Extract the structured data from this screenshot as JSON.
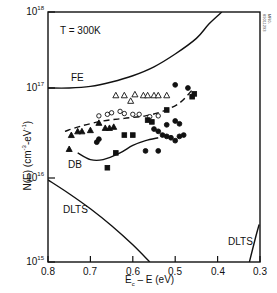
{
  "chart_data": {
    "type": "scatter",
    "title": "",
    "annotation_temperature": "T = 300K",
    "xlabel": "Ec – E (eV)",
    "xlabel_main": "E",
    "xlabel_sub": "c",
    "xlabel_rest": " – E (eV)",
    "ylabel": "N(E) (cm-3-eV-1)",
    "ylabel_parts": {
      "main": "N(E) (cm",
      "sup1": "-3",
      "mid": "-eV",
      "sup2": "-1",
      "end": ")"
    },
    "xlim": [
      0.8,
      0.3
    ],
    "x_reversed": true,
    "ylim": [
      1000000000000000.0,
      1e+18
    ],
    "yscale": "log",
    "x_ticks": [
      "0.8",
      "0.7",
      "0.6",
      "0.5",
      "0.4",
      "0.3"
    ],
    "y_ticks": [
      {
        "base": "10",
        "exp": "18"
      },
      {
        "base": "10",
        "exp": "17"
      },
      {
        "base": "10",
        "exp": "16"
      },
      {
        "base": "10",
        "exp": "15"
      }
    ],
    "curve_labels": {
      "fe": "FE",
      "db": "DB",
      "dlts_left": "DLTS",
      "dlts_right": "DLTS"
    },
    "figure_id": "MR0-89011293",
    "series": [
      {
        "name": "FE",
        "style": "solid-line",
        "points": [
          [
            0.8,
            1e+17
          ],
          [
            0.75,
            1e+17
          ],
          [
            0.7,
            1.05e+17
          ],
          [
            0.65,
            1.2e+17
          ],
          [
            0.6,
            1.45e+17
          ],
          [
            0.55,
            1.9e+17
          ],
          [
            0.5,
            2.8e+17
          ],
          [
            0.45,
            4.5e+17
          ],
          [
            0.42,
            7e+17
          ],
          [
            0.39,
            1e+18
          ]
        ]
      },
      {
        "name": "DB",
        "style": "solid-line",
        "points": [
          [
            0.73,
            1.9e+16
          ],
          [
            0.7,
            1.6e+16
          ],
          [
            0.67,
            1.6e+16
          ],
          [
            0.63,
            1.9e+16
          ],
          [
            0.6,
            2.3e+16
          ],
          [
            0.57,
            2.6e+16
          ],
          [
            0.54,
            2.8e+16
          ]
        ]
      },
      {
        "name": "Dashed fit",
        "style": "dashed-line",
        "points": [
          [
            0.76,
            3.3e+16
          ],
          [
            0.72,
            3.8e+16
          ],
          [
            0.67,
            4.3e+16
          ],
          [
            0.62,
            4.6e+16
          ],
          [
            0.57,
            4.9e+16
          ],
          [
            0.53,
            5.5e+16
          ],
          [
            0.49,
            6.8e+16
          ],
          [
            0.46,
            9.5e+16
          ]
        ]
      },
      {
        "name": "DLTS (left)",
        "style": "solid-line",
        "points": [
          [
            0.8,
            9500000000000000.0
          ],
          [
            0.75,
            6500000000000000.0
          ],
          [
            0.7,
            4300000000000000.0
          ],
          [
            0.65,
            2700000000000000.0
          ],
          [
            0.6,
            1600000000000000.0
          ],
          [
            0.56,
            1000000000000000.0
          ]
        ]
      },
      {
        "name": "DLTS (right)",
        "style": "solid-line",
        "points": [
          [
            0.325,
            1000000000000000.0
          ],
          [
            0.31,
            2000000000000000.0
          ],
          [
            0.302,
            2800000000000000.0
          ]
        ]
      },
      {
        "name": "Open triangles",
        "marker": "triangle-open",
        "points": [
          [
            0.64,
            8.3e+16
          ],
          [
            0.62,
            8.3e+16
          ],
          [
            0.605,
            7.2e+16
          ],
          [
            0.595,
            8.5e+16
          ],
          [
            0.575,
            8.3e+16
          ],
          [
            0.565,
            8.3e+16
          ],
          [
            0.55,
            8.3e+16
          ],
          [
            0.54,
            8.3e+16
          ],
          [
            0.52,
            8.3e+16
          ]
        ]
      },
      {
        "name": "Filled triangles",
        "marker": "triangle-filled",
        "points": [
          [
            0.75,
            2.1e+16
          ],
          [
            0.745,
            3e+16
          ],
          [
            0.73,
            3.3e+16
          ],
          [
            0.72,
            3.3e+16
          ],
          [
            0.7,
            3.4e+16
          ],
          [
            0.68,
            4.1e+16
          ],
          [
            0.665,
            3.6e+16
          ],
          [
            0.655,
            3.6e+16
          ],
          [
            0.645,
            3.7e+16
          ]
        ]
      },
      {
        "name": "Open circles",
        "marker": "circle-open",
        "points": [
          [
            0.68,
            4.9e+16
          ],
          [
            0.66,
            5.1e+16
          ],
          [
            0.65,
            5.3e+16
          ],
          [
            0.63,
            5.5e+16
          ],
          [
            0.62,
            5.2e+16
          ],
          [
            0.6,
            5.1e+16
          ],
          [
            0.585,
            5.1e+16
          ],
          [
            0.56,
            4.8e+16
          ],
          [
            0.54,
            4.9e+16
          ]
        ]
      },
      {
        "name": "Filled squares",
        "marker": "square-filled",
        "points": [
          [
            0.62,
            3e+16
          ],
          [
            0.6,
            3e+16
          ],
          [
            0.565,
            4.4e+16
          ],
          [
            0.555,
            4.2e+16
          ],
          [
            0.64,
            1.9e+16
          ],
          [
            0.66,
            1.3e+16
          ],
          [
            0.52,
            5.7e+16
          ],
          [
            0.46,
            8e+16
          ],
          [
            0.455,
            8.6e+16
          ]
        ]
      },
      {
        "name": "Filled circles",
        "marker": "circle-filled",
        "points": [
          [
            0.68,
            2.7e+16
          ],
          [
            0.685,
            2.5e+16
          ],
          [
            0.55,
            3.5e+16
          ],
          [
            0.54,
            3.3e+16
          ],
          [
            0.53,
            3e+16
          ],
          [
            0.52,
            2.9e+16
          ],
          [
            0.51,
            2.8e+16
          ],
          [
            0.5,
            2.6e+16
          ],
          [
            0.49,
            2.9e+16
          ],
          [
            0.48,
            3e+16
          ],
          [
            0.5,
            4.3e+16
          ],
          [
            0.52,
            3.9e+16
          ],
          [
            0.5,
            1.1e+17
          ],
          [
            0.47,
            1e+17
          ],
          [
            0.49,
            4e+16
          ],
          [
            0.57,
            2e+16
          ],
          [
            0.54,
            2e+16
          ]
        ]
      }
    ]
  }
}
